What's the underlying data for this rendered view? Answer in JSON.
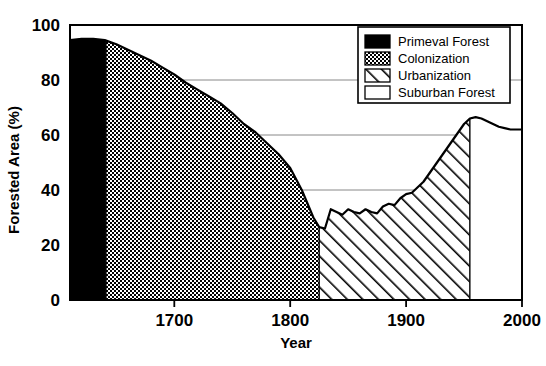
{
  "chart_data": {
    "type": "area",
    "title": "",
    "xlabel": "Year",
    "ylabel": "Forested Area (%)",
    "xlim": [
      1610,
      2000
    ],
    "ylim": [
      0,
      100
    ],
    "xticks": [
      1700,
      1800,
      1900,
      2000
    ],
    "xtick_labels": [
      "1700",
      "1800",
      "1900",
      "2000"
    ],
    "yticks": [
      0,
      20,
      40,
      60,
      80,
      100
    ],
    "ytick_labels": [
      "0",
      "20",
      "40",
      "60",
      "80",
      "100"
    ],
    "grid": "horizontal",
    "legend_position": "top-right",
    "series": [
      {
        "name": "Forested Area",
        "x": [
          1610,
          1620,
          1630,
          1640,
          1650,
          1660,
          1670,
          1680,
          1690,
          1700,
          1710,
          1720,
          1730,
          1740,
          1750,
          1760,
          1770,
          1780,
          1790,
          1800,
          1810,
          1815,
          1820,
          1825,
          1830,
          1835,
          1840,
          1845,
          1850,
          1855,
          1860,
          1865,
          1870,
          1875,
          1880,
          1885,
          1890,
          1895,
          1900,
          1905,
          1910,
          1915,
          1920,
          1925,
          1930,
          1935,
          1940,
          1945,
          1950,
          1955,
          1960,
          1965,
          1970,
          1975,
          1980,
          1985,
          1990,
          1995,
          2000
        ],
        "y": [
          94.5,
          95.0,
          95.0,
          94.5,
          93.0,
          91.0,
          89.0,
          87.0,
          84.5,
          82.0,
          79.0,
          76.5,
          74.0,
          71.5,
          68.0,
          64.0,
          61.0,
          57.0,
          53.0,
          48.0,
          40.0,
          35.0,
          30.0,
          26.5,
          26.0,
          33.0,
          32.0,
          31.0,
          33.0,
          32.0,
          31.5,
          33.0,
          32.0,
          31.5,
          34.0,
          35.0,
          34.5,
          37.0,
          38.5,
          39.0,
          41.0,
          43.0,
          46.0,
          49.0,
          52.0,
          55.0,
          58.0,
          61.0,
          64.0,
          66.0,
          66.5,
          66.0,
          65.0,
          64.0,
          63.0,
          62.5,
          62.0,
          62.0,
          62.0
        ]
      }
    ],
    "regions": [
      {
        "name": "Primeval Forest",
        "start": 1610,
        "end": 1641,
        "pattern": "solid-black"
      },
      {
        "name": "Colonization",
        "start": 1641,
        "end": 1825,
        "pattern": "dotted"
      },
      {
        "name": "Urbanization",
        "start": 1825,
        "end": 1955,
        "pattern": "diagonal-hatch"
      },
      {
        "name": "Suburban Forest",
        "start": 1955,
        "end": 2000,
        "pattern": "white"
      }
    ],
    "legend": [
      {
        "label": "Primeval Forest",
        "pattern": "solid-black"
      },
      {
        "label": "Colonization",
        "pattern": "dotted"
      },
      {
        "label": "Urbanization",
        "pattern": "diagonal-hatch"
      },
      {
        "label": "Suburban Forest",
        "pattern": "white"
      }
    ],
    "colors": {
      "line": "#000000",
      "axis": "#000000",
      "grid": "#888888",
      "background": "#ffffff"
    }
  }
}
